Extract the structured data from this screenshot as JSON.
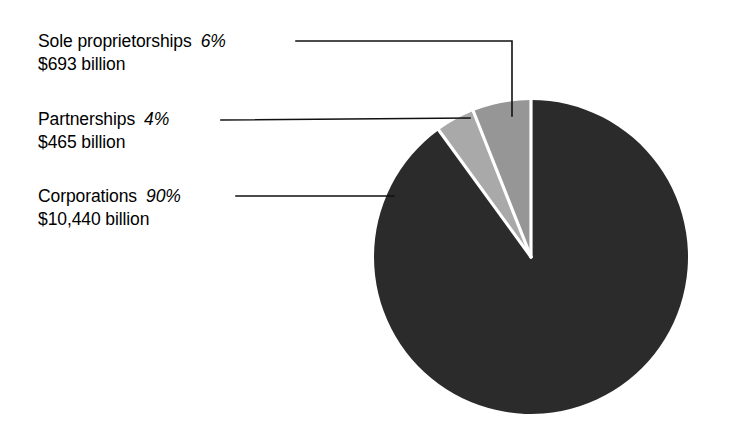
{
  "chart_data": {
    "type": "pie",
    "title": "",
    "subtitle": "",
    "xlabel": "",
    "ylabel": "",
    "legend_position": "callout-labels-left",
    "grid": false,
    "categories": [
      "Sole proprietorships",
      "Partnerships",
      "Corporations"
    ],
    "values": [
      6,
      4,
      90
    ],
    "value_unit": "percent",
    "amounts": [
      693,
      465,
      10440
    ],
    "amount_unit": "billion dollars",
    "slices": [
      {
        "label": "Sole proprietorships",
        "percent": 6,
        "percent_text": "6%",
        "amount_text": "$693 billion",
        "color": "#969696",
        "start_angle_deg": 338.4,
        "sweep_deg": 21.6
      },
      {
        "label": "Partnerships",
        "percent": 4,
        "percent_text": "4%",
        "amount_text": "$465 billion",
        "color": "#a9a9a9",
        "start_angle_deg": 324.0,
        "sweep_deg": 14.4
      },
      {
        "label": "Corporations",
        "percent": 90,
        "percent_text": "90%",
        "amount_text": "$10,440 billion",
        "color": "#2b2b2b",
        "start_angle_deg": 0.0,
        "sweep_deg": 324.0
      }
    ],
    "separator_color": "#ffffff",
    "background_color": "#ffffff",
    "text_color": "#000000"
  },
  "labels": {
    "sole": {
      "name": "Sole proprietorships",
      "percent": "6%",
      "amount": "$693 billion"
    },
    "partnerships": {
      "name": "Partnerships",
      "percent": "4%",
      "amount": "$465 billion"
    },
    "corporations": {
      "name": "Corporations",
      "percent": "90%",
      "amount": "$10,440 billion"
    }
  }
}
